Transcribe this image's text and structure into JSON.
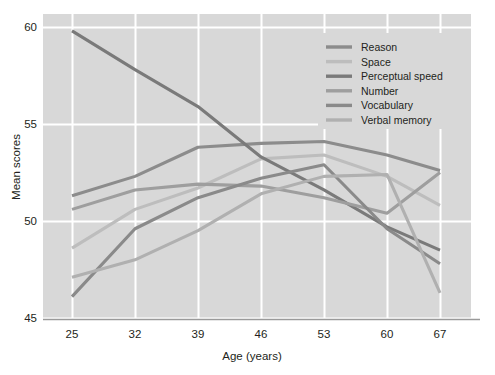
{
  "chart_data": {
    "type": "line",
    "title": "",
    "subtitle": "",
    "xlabel": "Age (years)",
    "ylabel": "Mean scores",
    "x": [
      25,
      32,
      39,
      46,
      53,
      60,
      67
    ],
    "categories": [
      "25",
      "32",
      "39",
      "46",
      "53",
      "60",
      "67"
    ],
    "xtick_labels": [
      "25",
      "32",
      "39",
      "46",
      "53",
      "60",
      "67"
    ],
    "ytick_labels": [
      "45",
      "50",
      "55",
      "60"
    ],
    "yticks": [
      45,
      50,
      55,
      60
    ],
    "xlim": [
      25,
      67
    ],
    "ylim": [
      45,
      60
    ],
    "grid": true,
    "grid_color": "#ffffff",
    "plot_background": "#d8d8d8",
    "page_background": "#ffffff",
    "legend_position": "top-right",
    "series": [
      {
        "name": "Reason",
        "color": "#8c8c8c",
        "values": [
          51.3,
          52.3,
          53.8,
          54.0,
          54.1,
          53.4,
          52.6
        ]
      },
      {
        "name": "Space",
        "color": "#bdbdbd",
        "values": [
          48.6,
          50.6,
          51.7,
          53.2,
          53.4,
          52.3,
          50.8
        ]
      },
      {
        "name": "Perceptual speed",
        "color": "#7a7a7a",
        "values": [
          59.8,
          57.8,
          55.9,
          53.3,
          51.6,
          49.7,
          48.5
        ]
      },
      {
        "name": "Number",
        "color": "#9e9e9e",
        "values": [
          50.6,
          51.6,
          51.9,
          51.8,
          51.2,
          50.4,
          52.5
        ]
      },
      {
        "name": "Vocabulary",
        "color": "#8a8a8a",
        "values": [
          46.1,
          49.6,
          51.2,
          52.2,
          52.9,
          49.6,
          47.8
        ]
      },
      {
        "name": "Verbal memory",
        "color": "#b0b0b0",
        "values": [
          47.1,
          48.0,
          49.5,
          51.4,
          52.3,
          52.4,
          46.3
        ]
      }
    ]
  },
  "axes": {
    "y_title": "Mean scores",
    "x_title": "Age (years)"
  },
  "legend": {
    "entries": [
      {
        "label": "Reason"
      },
      {
        "label": "Space"
      },
      {
        "label": "Perceptual speed"
      },
      {
        "label": "Number"
      },
      {
        "label": "Vocabulary"
      },
      {
        "label": "Verbal memory"
      }
    ]
  }
}
